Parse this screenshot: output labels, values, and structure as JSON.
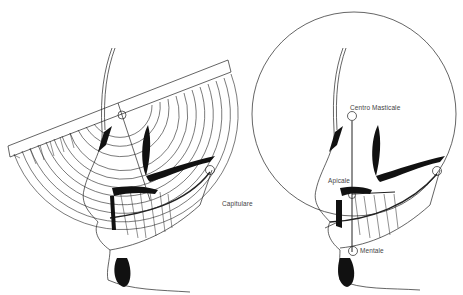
{
  "figure": {
    "left_panel": {
      "title": "Cephalometric protractor overlay",
      "labels": {
        "capitulare": "Capitulare"
      }
    },
    "right_panel": {
      "title": "Masticatory circle construction",
      "labels": {
        "centro_masticale": "Centro Masticale",
        "apicale": "Apicale",
        "mentale": "Mentale"
      }
    },
    "colors": {
      "line": "#222222",
      "fill": "#111111",
      "background": "#ffffff"
    }
  }
}
